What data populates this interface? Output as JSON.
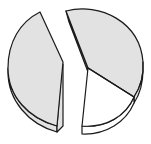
{
  "diagram": {
    "type": "exploded-3d-pie",
    "slices": [
      {
        "name": "left-slice",
        "fill": "#e2e2e2",
        "exploded": true
      },
      {
        "name": "top-right-slice",
        "fill": "#e2e2e2",
        "exploded": false
      },
      {
        "name": "bottom-slice",
        "fill": "#ffffff",
        "exploded": false
      }
    ],
    "outline_color": "#1a1a1a"
  }
}
